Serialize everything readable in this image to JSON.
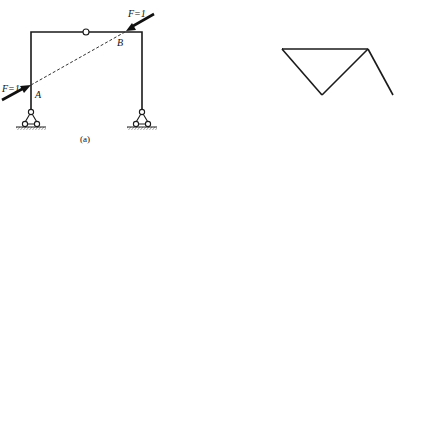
{
  "figure": {
    "panels": [
      {
        "id": "a",
        "caption": "(a)",
        "structure": "three-hinged frame",
        "labels": {
          "point_a": "A",
          "point_b": "B",
          "force_left": "F=1",
          "force_right": "F=1"
        },
        "note": "pair of opposite unit forces along dashed line AB"
      },
      {
        "id": "b",
        "caption": "(b)",
        "structure": "truss",
        "labels": {
          "point_a": "A",
          "point_b": "B"
        },
        "note": "pair of opposite unit forces along dashed line AB"
      },
      {
        "id": "c",
        "caption": "(c)",
        "structure": "three-hinged frame",
        "labels": {
          "moment": "M",
          "moment_sub": "e",
          "moment_val": "=1",
          "point_k": "K"
        },
        "note": "unit moment at joint K"
      },
      {
        "id": "d",
        "caption": "(d)",
        "structure": "truss",
        "labels": {
          "member": "l",
          "member_sub": "i",
          "force_top": "1/l",
          "force_top_sub": "i",
          "force_bottom": "1/l",
          "force_bottom_sub": "i"
        },
        "note": "pair of forces 1/l_i perpendicular to member i"
      },
      {
        "id": "e",
        "caption": "(e)",
        "structure": "three-hinged frame",
        "labels": {
          "moment_left": "M",
          "moment_left_sub": "e",
          "moment_left_val": "=1",
          "moment_right": "M",
          "moment_right_sub": "e",
          "moment_right_val": "=1",
          "point_c": "C"
        },
        "note": "pair of opposite unit moments at hinge C"
      },
      {
        "id": "f",
        "caption": "(f)",
        "structure": "truss",
        "labels": {
          "member_i": "l",
          "member_i_sub": "i",
          "member_j": "l",
          "member_j_sub": "j",
          "f1": "1/l",
          "f1_sub": "i",
          "f2": "1/l",
          "f2_sub": "i",
          "f3": "1/l",
          "f3_sub": "j",
          "f4": "1/l",
          "f4_sub": "j"
        },
        "note": "two pairs of forces for relative rotation between members i and j"
      }
    ]
  }
}
